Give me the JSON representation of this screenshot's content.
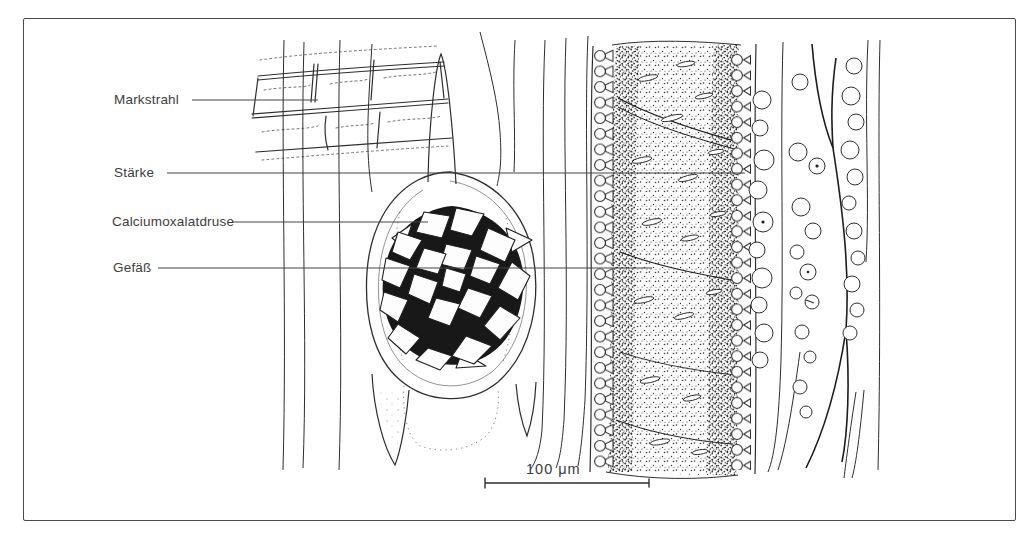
{
  "figure": {
    "type": "botanical-microscopy-line-drawing",
    "background_color": "#ffffff",
    "ink_color": "#2e2e2e",
    "label_color": "#3d3d3d",
    "labels": [
      {
        "id": "markstrahl",
        "text": "Markstrahl"
      },
      {
        "id": "staerke",
        "text": "Stärke"
      },
      {
        "id": "calciumoxalatdruse",
        "text": "Calciumoxalatdruse"
      },
      {
        "id": "gefaess",
        "text": "Gefäß"
      }
    ],
    "scale_bar": {
      "text": "100 μm"
    }
  }
}
